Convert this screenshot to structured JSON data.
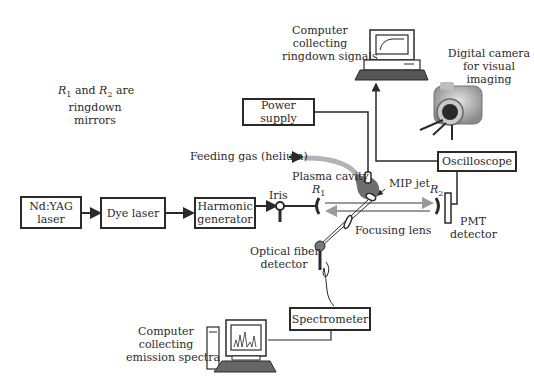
{
  "note": {
    "r1": "R",
    "r1_sub": "1",
    "and": " and ",
    "r2": "R",
    "r2_sub": "2",
    "line1_tail": " are",
    "line2": "ringdown",
    "line3": "mirrors"
  },
  "boxes": {
    "ndyag": {
      "line1": "Nd:YAG",
      "line2": "laser"
    },
    "dye": "Dye laser",
    "harmonic": {
      "line1": "Harmonic",
      "line2": "generator"
    },
    "power": "Power supply",
    "oscilloscope": "Oscilloscope",
    "spectrometer": "Spectrometer"
  },
  "labels": {
    "computer_ringdown": [
      "Computer",
      "collecting",
      "ringdown signals"
    ],
    "camera": [
      "Digital camera",
      "for visual",
      "imaging"
    ],
    "feeding_gas": "Feeding gas (helium)",
    "plasma_cavity": "Plasma cavity",
    "mip_jet": "MIP jet",
    "iris": "Iris",
    "r1": "R",
    "r1_sub": "1",
    "r2": "R",
    "r2_sub": "2",
    "pmt": [
      "PMT",
      "detector"
    ],
    "focusing_lens": "Focusing lens",
    "optical_fiber": [
      "Optical fiber",
      "detector"
    ],
    "computer_emission": [
      "Computer",
      "collecting",
      "emission spectra"
    ]
  }
}
